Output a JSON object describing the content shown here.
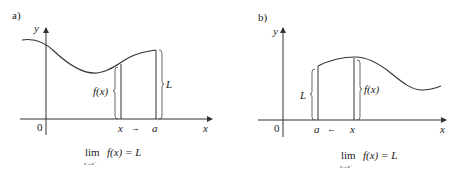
{
  "panels": [
    {
      "label": "a)",
      "y_axis": "y",
      "x_axis": "x",
      "origin": "0",
      "x_label": "x",
      "a_label": "a",
      "arrow": "→",
      "fx_label": "f(x)",
      "L_label": "L",
      "limit": {
        "lim": "lim",
        "sub": "x→a⁻",
        "expr": "f(x) = L"
      }
    },
    {
      "label": "b)",
      "y_axis": "y",
      "x_axis": "x",
      "origin": "0",
      "x_label": "x",
      "a_label": "a",
      "arrow": "←",
      "fx_label": "f(x)",
      "L_label": "L",
      "limit": {
        "lim": "lim",
        "sub": "x→a⁺",
        "expr": "f(x) = L"
      }
    }
  ]
}
